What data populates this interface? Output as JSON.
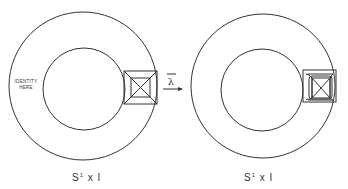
{
  "figure": {
    "left_panel": {
      "annotation_line1": "IDENTITY",
      "annotation_line2": "HERE",
      "caption_base": "S",
      "caption_sup": "1",
      "caption_rest": " x I"
    },
    "arrow": {
      "label": "λ"
    },
    "right_panel": {
      "caption_base": "S",
      "caption_sup": "1",
      "caption_rest": " x I"
    },
    "colors": {
      "line": "#333333",
      "background": "#ffffff"
    }
  }
}
